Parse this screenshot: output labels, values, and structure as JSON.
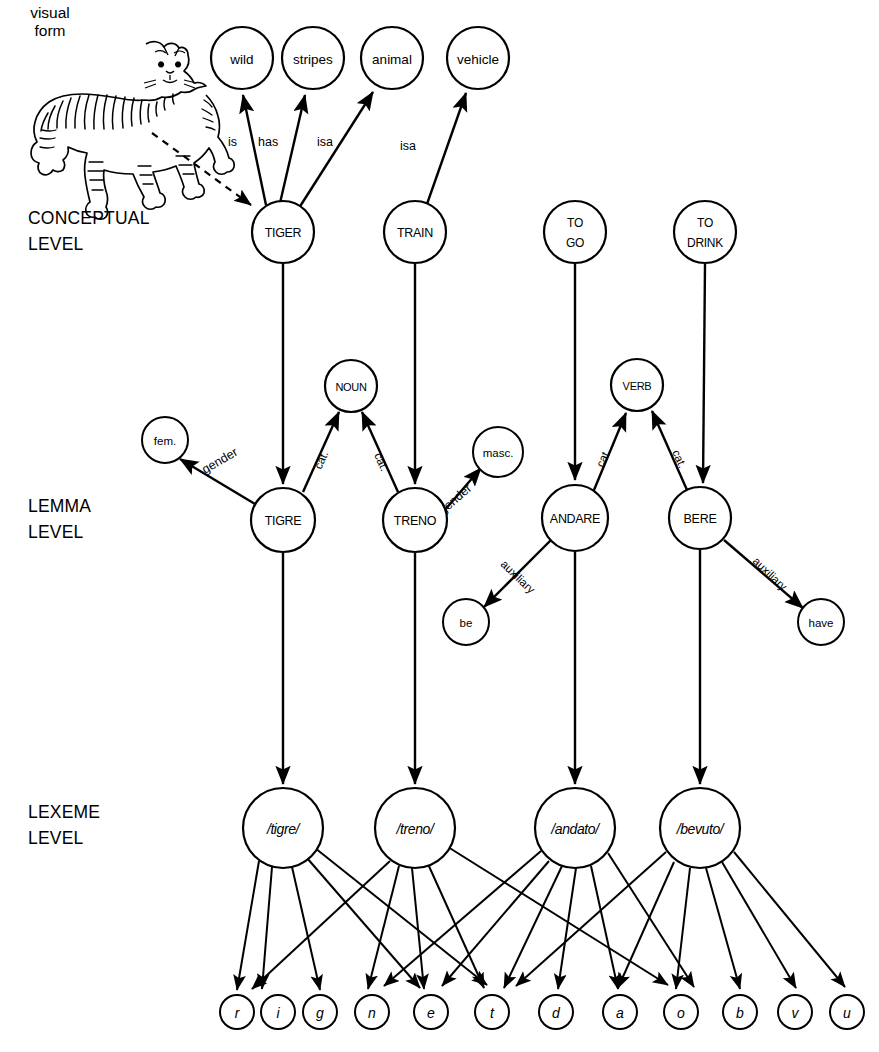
{
  "figure": {
    "background": "#ffffff",
    "ink": "#000000"
  },
  "visual_form": {
    "line1": "visual",
    "line2": "form",
    "image": "tiger-line-drawing"
  },
  "levels": [
    {
      "id": "conceptual",
      "line1": "CONCEPTUAL",
      "line2": "LEVEL"
    },
    {
      "id": "lemma",
      "line1": "LEMMA",
      "line2": "LEVEL"
    },
    {
      "id": "lexeme",
      "line1": "LEXEME",
      "line2": "LEVEL"
    }
  ],
  "semantic_nodes": [
    {
      "id": "wild",
      "label": "wild",
      "cx": 242,
      "cy": 58,
      "r": 31
    },
    {
      "id": "stripes",
      "label": "stripes",
      "cx": 313,
      "cy": 58,
      "r": 31
    },
    {
      "id": "animal",
      "label": "animal",
      "cx": 392,
      "cy": 58,
      "r": 31
    },
    {
      "id": "vehicle",
      "label": "vehicle",
      "cx": 478,
      "cy": 58,
      "r": 31
    }
  ],
  "conceptual_nodes": [
    {
      "id": "tiger",
      "label": "TIGER",
      "label2": "",
      "cx": 283,
      "cy": 232,
      "r": 31
    },
    {
      "id": "train",
      "label": "TRAIN",
      "label2": "",
      "cx": 415,
      "cy": 232,
      "r": 31
    },
    {
      "id": "to-go",
      "label": "TO",
      "label2": "GO",
      "cx": 575,
      "cy": 232,
      "r": 31
    },
    {
      "id": "to-drink",
      "label": "TO",
      "label2": "DRINK",
      "cx": 705,
      "cy": 232,
      "r": 31
    }
  ],
  "category_nodes": [
    {
      "id": "noun",
      "label": "NOUN",
      "cx": 351,
      "cy": 386,
      "r": 26
    },
    {
      "id": "verb",
      "label": "VERB",
      "cx": 637,
      "cy": 385,
      "r": 26
    }
  ],
  "gender_nodes": [
    {
      "id": "fem",
      "label": "fem.",
      "cx": 165,
      "cy": 440,
      "r": 23
    },
    {
      "id": "masc",
      "label": "masc.",
      "cx": 498,
      "cy": 452,
      "r": 25
    }
  ],
  "lemma_nodes": [
    {
      "id": "tigre",
      "label": "TIGRE",
      "cx": 283,
      "cy": 520,
      "r": 32
    },
    {
      "id": "treno",
      "label": "TRENO",
      "cx": 415,
      "cy": 520,
      "r": 32
    },
    {
      "id": "andare",
      "label": "ANDARE",
      "cx": 575,
      "cy": 518,
      "r": 33
    },
    {
      "id": "bere",
      "label": "BERE",
      "cx": 700,
      "cy": 518,
      "r": 31
    }
  ],
  "auxiliary_nodes": [
    {
      "id": "be",
      "label": "be",
      "cx": 466,
      "cy": 622,
      "r": 23
    },
    {
      "id": "have",
      "label": "have",
      "cx": 821,
      "cy": 622,
      "r": 23
    }
  ],
  "lexeme_nodes": [
    {
      "id": "tigre-lex",
      "label": "/tigre/",
      "cx": 283,
      "cy": 828,
      "r": 40
    },
    {
      "id": "treno-lex",
      "label": "/treno/",
      "cx": 415,
      "cy": 828,
      "r": 40
    },
    {
      "id": "andato-lex",
      "label": "/andato/",
      "cx": 575,
      "cy": 828,
      "r": 40
    },
    {
      "id": "bevuto-lex",
      "label": "/bevuto/",
      "cx": 700,
      "cy": 828,
      "r": 40
    }
  ],
  "phoneme_nodes": [
    {
      "id": "r",
      "label": "r",
      "cx": 237,
      "cy": 1012,
      "r": 17
    },
    {
      "id": "i",
      "label": "i",
      "cx": 278,
      "cy": 1012,
      "r": 17
    },
    {
      "id": "g",
      "label": "g",
      "cx": 320,
      "cy": 1012,
      "r": 17
    },
    {
      "id": "n",
      "label": "n",
      "cx": 372,
      "cy": 1012,
      "r": 17
    },
    {
      "id": "e",
      "label": "e",
      "cx": 431,
      "cy": 1012,
      "r": 17
    },
    {
      "id": "t",
      "label": "t",
      "cx": 492,
      "cy": 1012,
      "r": 17
    },
    {
      "id": "d",
      "label": "d",
      "cx": 556,
      "cy": 1012,
      "r": 17
    },
    {
      "id": "a",
      "label": "a",
      "cx": 620,
      "cy": 1012,
      "r": 17
    },
    {
      "id": "o",
      "label": "o",
      "cx": 681,
      "cy": 1012,
      "r": 17
    },
    {
      "id": "b",
      "label": "b",
      "cx": 740,
      "cy": 1012,
      "r": 17
    },
    {
      "id": "v",
      "label": "v",
      "cx": 795,
      "cy": 1012,
      "r": 17
    },
    {
      "id": "u",
      "label": "u",
      "cx": 847,
      "cy": 1012,
      "r": 17
    }
  ],
  "edge_labels": [
    {
      "id": "is",
      "text": "is",
      "x": 234,
      "y": 146,
      "rotate": 0
    },
    {
      "id": "has",
      "text": "has",
      "x": 264,
      "y": 146,
      "rotate": 0
    },
    {
      "id": "isa-animal",
      "text": "isa",
      "x": 324,
      "y": 146,
      "rotate": 0
    },
    {
      "id": "isa-vehicle",
      "text": "isa",
      "x": 406,
      "y": 150,
      "rotate": 0
    },
    {
      "id": "gender-fem",
      "text": "gender",
      "x": 205,
      "y": 474,
      "rotate": -53
    },
    {
      "id": "cat-tigre",
      "text": "cat.",
      "x": 327,
      "y": 466,
      "rotate": -68
    },
    {
      "id": "cat-treno",
      "text": "cat.",
      "x": 369,
      "y": 465,
      "rotate": 68
    },
    {
      "id": "gender-masc",
      "text": "gender",
      "x": 455,
      "y": 505,
      "rotate": -42
    },
    {
      "id": "cat-andare",
      "text": "cat.",
      "x": 606,
      "y": 462,
      "rotate": -65
    },
    {
      "id": "cat-bere",
      "text": "cat.",
      "x": 668,
      "y": 462,
      "rotate": 63
    },
    {
      "id": "aux-be",
      "text": "auxiliary",
      "x": 506,
      "y": 573,
      "rotate": 43
    },
    {
      "id": "aux-have",
      "text": "auxiliary",
      "x": 760,
      "y": 570,
      "rotate": 43
    }
  ],
  "edges": {
    "visual_to_tiger": {
      "from": "visual-form",
      "to": "tiger",
      "style": "dashed-arrow"
    },
    "semantic": [
      {
        "from": "tiger",
        "to": "wild",
        "label": "is"
      },
      {
        "from": "tiger",
        "to": "stripes",
        "label": "has"
      },
      {
        "from": "tiger",
        "to": "animal",
        "label": "isa"
      },
      {
        "from": "train",
        "to": "vehicle",
        "label": "isa"
      }
    ],
    "concept_to_lemma": [
      {
        "from": "tiger",
        "to": "tigre"
      },
      {
        "from": "train",
        "to": "treno"
      },
      {
        "from": "to-go",
        "to": "andare"
      },
      {
        "from": "to-drink",
        "to": "bere"
      }
    ],
    "lemma_features": [
      {
        "from": "tigre",
        "to": "fem",
        "label": "gender"
      },
      {
        "from": "tigre",
        "to": "noun",
        "label": "cat."
      },
      {
        "from": "treno",
        "to": "noun",
        "label": "cat."
      },
      {
        "from": "treno",
        "to": "masc",
        "label": "gender"
      },
      {
        "from": "andare",
        "to": "verb",
        "label": "cat."
      },
      {
        "from": "bere",
        "to": "verb",
        "label": "cat."
      },
      {
        "from": "andare",
        "to": "be",
        "label": "auxiliary"
      },
      {
        "from": "bere",
        "to": "have",
        "label": "auxiliary"
      }
    ],
    "lemma_to_lexeme": [
      {
        "from": "tigre",
        "to": "tigre-lex"
      },
      {
        "from": "treno",
        "to": "treno-lex"
      },
      {
        "from": "andare",
        "to": "andato-lex"
      },
      {
        "from": "bere",
        "to": "bevuto-lex"
      }
    ],
    "lexeme_to_phoneme": [
      {
        "from": "tigre-lex",
        "to": [
          "t",
          "i",
          "g",
          "r",
          "e"
        ]
      },
      {
        "from": "treno-lex",
        "to": [
          "t",
          "r",
          "e",
          "n",
          "o"
        ]
      },
      {
        "from": "andato-lex",
        "to": [
          "a",
          "n",
          "d",
          "t",
          "o"
        ]
      },
      {
        "from": "bevuto-lex",
        "to": [
          "b",
          "e",
          "v",
          "u",
          "t",
          "o"
        ]
      }
    ]
  }
}
